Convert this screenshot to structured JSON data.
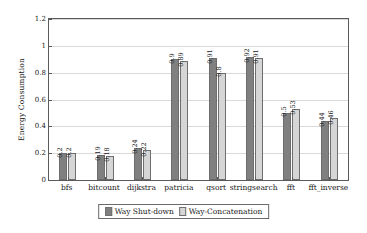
{
  "chart_data": {
    "type": "bar",
    "title": "",
    "xlabel": "",
    "ylabel": "Energy Consumption",
    "ylim": [
      0,
      1.2
    ],
    "yticks": [
      "0",
      "0.2",
      "0.4",
      "0.6",
      "0.8",
      "1",
      "1.2"
    ],
    "ytick_values": [
      0,
      0.2,
      0.4,
      0.6,
      0.8,
      1,
      1.2
    ],
    "grid": true,
    "legend_position": "bottom-center",
    "categories": [
      "bfs",
      "bitcount",
      "dijkstra",
      "patricia",
      "qsort",
      "stringsearch",
      "fft",
      "fft_inverse"
    ],
    "series": [
      {
        "name": "Way Shut-down",
        "color": "#808080",
        "values": [
          0.2,
          0.19,
          0.24,
          0.9,
          0.91,
          0.92,
          0.5,
          0.44
        ],
        "labels": [
          "0.2",
          "0.19",
          "0.24",
          "0.9",
          "0.91",
          "0.92",
          "0.5",
          "0.44"
        ]
      },
      {
        "name": "Way-Concatenation",
        "color": "#d6d6d6",
        "values": [
          0.2,
          0.18,
          0.22,
          0.89,
          0.8,
          0.91,
          0.53,
          0.46
        ],
        "labels": [
          "0.2",
          "0.18",
          "0.22",
          "0.89",
          "0.8",
          "0.91",
          "0.53",
          "0.46"
        ]
      }
    ]
  }
}
